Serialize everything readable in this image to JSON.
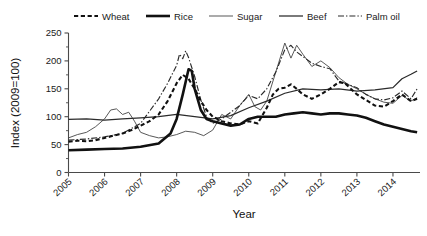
{
  "chart_data": {
    "type": "line",
    "title": "",
    "xlabel": "Year",
    "ylabel": "Index (2009=100)",
    "xlim": [
      2005.0,
      2014.75
    ],
    "ylim": [
      0,
      250
    ],
    "grid": false,
    "legend_position": "top",
    "y_ticks": [
      0,
      50,
      100,
      150,
      200,
      250
    ],
    "y_minor_ticks": [
      25,
      75,
      125,
      175,
      225
    ],
    "x_ticks": [
      2005,
      2006,
      2007,
      2008,
      2009,
      2010,
      2011,
      2012,
      2013,
      2014
    ],
    "x_tick_labels": [
      "2005",
      "2006",
      "2007",
      "2008",
      "2009",
      "2010",
      "2011",
      "2012",
      "2013",
      "2014"
    ],
    "series": [
      {
        "name": "Wheat",
        "style": "dashed",
        "color": "#111111",
        "x": [
          2005.0,
          2005.25,
          2005.5,
          2005.75,
          2006.0,
          2006.25,
          2006.5,
          2006.75,
          2007.0,
          2007.25,
          2007.5,
          2007.75,
          2008.0,
          2008.17,
          2008.33,
          2008.5,
          2008.67,
          2008.83,
          2009.0,
          2009.25,
          2009.5,
          2009.75,
          2010.0,
          2010.25,
          2010.5,
          2010.67,
          2010.83,
          2011.0,
          2011.17,
          2011.33,
          2011.5,
          2011.75,
          2012.0,
          2012.25,
          2012.5,
          2012.67,
          2012.83,
          2013.0,
          2013.25,
          2013.5,
          2013.75,
          2014.0,
          2014.25,
          2014.5,
          2014.67
        ],
        "y": [
          55,
          57,
          56,
          58,
          62,
          66,
          70,
          76,
          84,
          92,
          104,
          128,
          160,
          175,
          168,
          150,
          128,
          112,
          100,
          92,
          88,
          86,
          92,
          88,
          116,
          140,
          150,
          152,
          158,
          150,
          140,
          132,
          140,
          150,
          162,
          160,
          150,
          140,
          130,
          120,
          118,
          128,
          140,
          128,
          132
        ]
      },
      {
        "name": "Rice",
        "style": "thick-solid",
        "color": "#111111",
        "x": [
          2005.0,
          2005.5,
          2006.0,
          2006.5,
          2007.0,
          2007.5,
          2007.83,
          2008.0,
          2008.17,
          2008.33,
          2008.42,
          2008.5,
          2008.67,
          2008.83,
          2009.0,
          2009.25,
          2009.5,
          2009.75,
          2010.0,
          2010.25,
          2010.5,
          2010.75,
          2011.0,
          2011.25,
          2011.5,
          2011.75,
          2012.0,
          2012.25,
          2012.5,
          2012.75,
          2013.0,
          2013.25,
          2013.5,
          2013.75,
          2014.0,
          2014.25,
          2014.5,
          2014.67
        ],
        "y": [
          40,
          41,
          42,
          43,
          46,
          52,
          70,
          96,
          140,
          185,
          182,
          150,
          112,
          96,
          92,
          88,
          84,
          86,
          96,
          100,
          100,
          100,
          104,
          106,
          108,
          106,
          104,
          106,
          106,
          104,
          102,
          98,
          92,
          86,
          82,
          78,
          74,
          72
        ]
      },
      {
        "name": "Sugar",
        "style": "thin-solid",
        "color": "#3a3a3a",
        "x": [
          2005.0,
          2005.25,
          2005.5,
          2005.75,
          2006.0,
          2006.17,
          2006.33,
          2006.5,
          2006.67,
          2006.83,
          2007.0,
          2007.25,
          2007.5,
          2007.75,
          2008.0,
          2008.25,
          2008.5,
          2008.75,
          2009.0,
          2009.25,
          2009.5,
          2009.75,
          2010.0,
          2010.17,
          2010.33,
          2010.5,
          2010.75,
          2011.0,
          2011.17,
          2011.33,
          2011.5,
          2011.75,
          2012.0,
          2012.25,
          2012.5,
          2012.75,
          2013.0,
          2013.25,
          2013.5,
          2013.75,
          2014.0,
          2014.25,
          2014.5,
          2014.67
        ],
        "y": [
          62,
          68,
          72,
          82,
          96,
          112,
          114,
          104,
          108,
          92,
          72,
          66,
          62,
          64,
          68,
          74,
          72,
          66,
          76,
          104,
          96,
          120,
          140,
          118,
          112,
          128,
          180,
          232,
          205,
          228,
          212,
          190,
          200,
          188,
          170,
          158,
          150,
          140,
          132,
          126,
          124,
          138,
          128,
          134
        ]
      },
      {
        "name": "Beef",
        "style": "solid",
        "color": "#2b2b2b",
        "x": [
          2005.0,
          2005.5,
          2006.0,
          2006.5,
          2007.0,
          2007.5,
          2008.0,
          2008.5,
          2009.0,
          2009.5,
          2010.0,
          2010.5,
          2011.0,
          2011.5,
          2012.0,
          2012.5,
          2013.0,
          2013.5,
          2014.0,
          2014.25,
          2014.5,
          2014.67
        ],
        "y": [
          95,
          96,
          94,
          96,
          98,
          100,
          104,
          100,
          96,
          102,
          116,
          128,
          142,
          150,
          148,
          150,
          146,
          148,
          152,
          168,
          176,
          182
        ]
      },
      {
        "name": "Palm oil",
        "style": "dash-dot",
        "color": "#2b2b2b",
        "x": [
          2005.0,
          2005.5,
          2006.0,
          2006.5,
          2007.0,
          2007.25,
          2007.5,
          2007.75,
          2008.0,
          2008.08,
          2008.17,
          2008.25,
          2008.33,
          2008.5,
          2008.67,
          2008.83,
          2009.0,
          2009.25,
          2009.5,
          2009.75,
          2010.0,
          2010.25,
          2010.5,
          2010.75,
          2011.0,
          2011.17,
          2011.33,
          2011.5,
          2011.75,
          2012.0,
          2012.25,
          2012.5,
          2012.75,
          2013.0,
          2013.25,
          2013.5,
          2013.75,
          2014.0,
          2014.25,
          2014.5,
          2014.67
        ],
        "y": [
          58,
          60,
          64,
          70,
          88,
          110,
          132,
          160,
          192,
          212,
          204,
          218,
          206,
          172,
          130,
          100,
          88,
          96,
          108,
          120,
          138,
          132,
          150,
          180,
          220,
          228,
          216,
          208,
          196,
          190,
          186,
          164,
          158,
          152,
          140,
          132,
          130,
          134,
          146,
          132,
          150
        ]
      }
    ]
  },
  "legend": {
    "items": [
      {
        "label": "Wheat"
      },
      {
        "label": "Rice"
      },
      {
        "label": "Sugar"
      },
      {
        "label": "Beef"
      },
      {
        "label": "Palm oil"
      }
    ]
  },
  "axes": {
    "y_title": "Index (2009=100)",
    "x_title": "Year",
    "y_labels": [
      "250",
      "200",
      "150",
      "100",
      "50",
      "0"
    ],
    "x_labels": [
      "2005",
      "2006",
      "2007",
      "2008",
      "2009",
      "2010",
      "2011",
      "2012",
      "2013",
      "2014"
    ]
  }
}
